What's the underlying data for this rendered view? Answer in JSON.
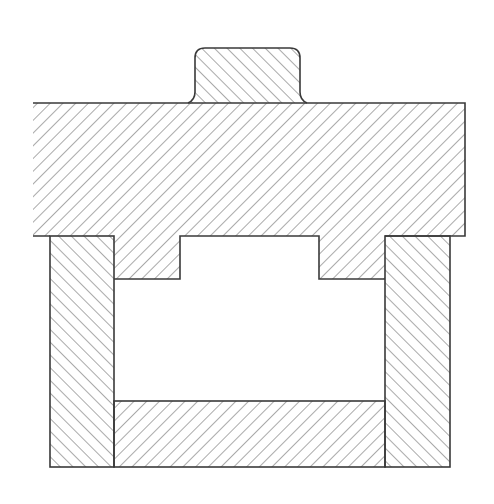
{
  "diagram": {
    "colors": {
      "background": "#ffffff",
      "line": "#3a3a3a",
      "hatch": "#555555"
    },
    "hatch_spacing": 9,
    "parts": [
      {
        "id": "top-tab",
        "label": "Top tab",
        "hatch": "backslash"
      },
      {
        "id": "main-block",
        "label": "Main block with lower protrusion",
        "hatch": "forward-slash"
      },
      {
        "id": "left-column",
        "label": "Left column",
        "hatch": "backslash"
      },
      {
        "id": "right-column",
        "label": "Right column",
        "hatch": "backslash"
      },
      {
        "id": "bottom-plate",
        "label": "Bottom plate",
        "hatch": "forward-slash"
      },
      {
        "id": "cavity",
        "label": "Internal cavity",
        "hatch": "none"
      }
    ]
  }
}
